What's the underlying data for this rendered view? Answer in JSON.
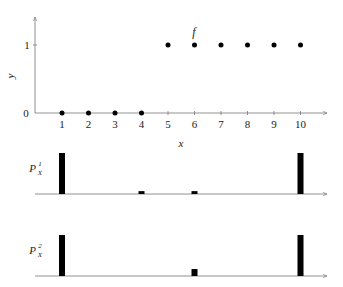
{
  "chart_data": [
    {
      "type": "scatter",
      "title": "f",
      "xlabel": "x",
      "ylabel": "y",
      "x": [
        1,
        2,
        3,
        4,
        5,
        6,
        7,
        8,
        9,
        10
      ],
      "values": [
        0,
        0,
        0,
        0,
        1,
        1,
        1,
        1,
        1,
        1
      ],
      "xticks": [
        "1",
        "2",
        "3",
        "4",
        "5",
        "6",
        "7",
        "8",
        "9",
        "10"
      ],
      "yticks": [
        "0",
        "1"
      ],
      "ylim": [
        0,
        1.3
      ],
      "grid": false
    },
    {
      "type": "bar",
      "label": "P_X^1",
      "label_base": "P",
      "label_sub": "X",
      "label_sup": "1",
      "x": [
        1,
        4,
        6,
        10
      ],
      "values": [
        1.0,
        0.07,
        0.07,
        1.0
      ]
    },
    {
      "type": "bar",
      "label": "P_X^2",
      "label_base": "P",
      "label_sub": "X",
      "label_sup": "2",
      "x": [
        1,
        6,
        10
      ],
      "values": [
        1.0,
        0.17,
        1.0
      ]
    }
  ],
  "labels": {
    "f": "f",
    "x": "x",
    "y": "y",
    "ytick0": "0",
    "ytick1": "1",
    "p1_base": "P",
    "p1_sub": "X",
    "p1_sup": "1",
    "p2_base": "P",
    "p2_sub": "X",
    "p2_sup": "2"
  },
  "colors": {
    "axis": "#777777",
    "marks": "#000000",
    "text": "#222222"
  }
}
